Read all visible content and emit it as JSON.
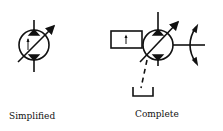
{
  "figure": {
    "symbols": [
      {
        "id": "simplified",
        "label": "Simplified",
        "description": "Variable displacement hydraulic pump/motor, simplified symbol"
      },
      {
        "id": "complete",
        "label": "Complete",
        "description": "Variable displacement hydraulic pump/motor with control, drain line and shaft, complete symbol"
      }
    ],
    "colors": {
      "stroke": "#111111",
      "background": "#ffffff"
    }
  }
}
